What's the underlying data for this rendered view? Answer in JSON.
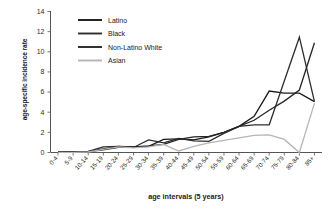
{
  "chart_data": {
    "type": "line",
    "title": "",
    "xlabel": "age intervals (5 years)",
    "ylabel": "age-specific incidence rate",
    "ylim": [
      0,
      14
    ],
    "yticks": [
      0,
      2,
      4,
      6,
      8,
      10,
      12,
      14
    ],
    "grid": false,
    "legend_position": "top-left",
    "categories": [
      "0-4",
      "5-9",
      "10-14",
      "15-19",
      "20-24",
      "25-29",
      "30-34",
      "35-39",
      "40-44",
      "45-49",
      "50-54",
      "55-59",
      "60-64",
      "65-69",
      "70-74",
      "75-79",
      "80-84",
      "85+"
    ],
    "series": [
      {
        "name": "Latino",
        "color": "#1a1a1a",
        "values": [
          0.05,
          0.05,
          0.08,
          0.35,
          0.6,
          0.55,
          0.6,
          1.3,
          1.35,
          1.25,
          1.55,
          2.0,
          2.6,
          3.6,
          6.1,
          5.9,
          5.9,
          5.05
        ]
      },
      {
        "name": "Black",
        "color": "#2e2e2e",
        "values": [
          0.05,
          0.05,
          0.1,
          0.55,
          0.6,
          0.5,
          1.25,
          0.95,
          1.4,
          1.15,
          1.1,
          1.9,
          2.6,
          2.75,
          2.75,
          7.1,
          11.45,
          5.05
        ]
      },
      {
        "name": "Non-Latino White",
        "color": "#262626",
        "values": [
          0.05,
          0.05,
          0.08,
          0.25,
          0.5,
          0.55,
          0.65,
          0.8,
          1.3,
          1.55,
          1.6,
          2.0,
          2.6,
          3.2,
          4.2,
          5.1,
          6.2,
          10.9
        ]
      },
      {
        "name": "Asian",
        "color": "#b5b5b5",
        "values": [
          0.02,
          0.02,
          0.05,
          0.3,
          0.55,
          0.45,
          0.55,
          0.8,
          0.15,
          0.6,
          0.95,
          1.2,
          1.45,
          1.7,
          1.75,
          1.3,
          0.0,
          4.9
        ]
      }
    ]
  },
  "legend": {
    "items": [
      {
        "label": "Latino"
      },
      {
        "label": "Black"
      },
      {
        "label": "Non-Latino White"
      },
      {
        "label": "Asian"
      }
    ]
  }
}
